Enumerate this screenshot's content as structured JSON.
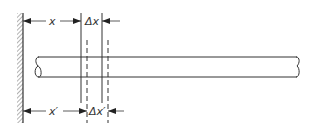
{
  "diagram": {
    "colors": {
      "line": "#333333",
      "background": "#ffffff"
    },
    "labels": {
      "x": "x",
      "delta_x": "Δx",
      "x_prime": "x′",
      "delta_x_prime": "Δx′"
    },
    "elements": {
      "wall": {
        "x": 23,
        "y_top": 13,
        "y_bottom": 123,
        "hatch_width": 6
      },
      "rod": {
        "x_left": 37,
        "x_right": 298,
        "y_top": 57,
        "y_bottom": 77
      },
      "solid_lines": [
        81,
        102
      ],
      "dashed_lines": [
        87,
        108
      ],
      "top_dimension_y": 21,
      "bottom_dimension_y": 111
    }
  }
}
